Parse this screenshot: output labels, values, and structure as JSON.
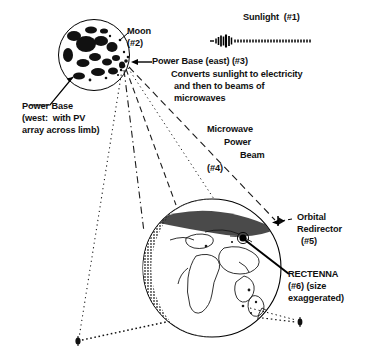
{
  "diagram": {
    "background_color": "#ffffff",
    "ink_color": "#000000"
  },
  "labels": {
    "sunlight": "Sunlight  (#1)",
    "moon_line1": "Moon",
    "moon_line2": "(#2)",
    "power_base_east_heading": "Power Base (east) (#3)",
    "power_base_east_desc_line1": "Converts sunlight to electricity",
    "power_base_east_desc_line2": "and then to beams of",
    "power_base_east_desc_line3": "microwaves",
    "power_base_west_line1": "Power Base",
    "power_base_west_line2": "(west:  with PV",
    "power_base_west_line3": "array across limb)",
    "microwave_beam_line1": "Microwave",
    "microwave_beam_line2": "Power",
    "microwave_beam_line3": "Beam",
    "microwave_beam_line4": "(#4)",
    "orbital_redirector_line1": "Orbital",
    "orbital_redirector_line2": "Redirector",
    "orbital_redirector_line3": "(#5)",
    "rectenna_line1": "RECTENNA",
    "rectenna_line2": "(#6) (size",
    "rectenna_line3": "exaggerated)"
  },
  "elements": {
    "moon": {
      "name": "Moon",
      "callout_number": "#2",
      "center_x": 94,
      "center_y": 55,
      "radius": 36,
      "lit_side": "east",
      "shaded_side": "west"
    },
    "earth": {
      "name": "Earth",
      "center_x": 212,
      "center_y": 268,
      "radius": 70,
      "terminator_side": "west"
    },
    "power_base_east": {
      "callout_number": "#3",
      "x": 126,
      "y": 62
    },
    "power_base_west": {
      "callout_number": "#2-west",
      "x": 66,
      "y": 78
    },
    "rectenna": {
      "callout_number": "#6",
      "x": 243,
      "y": 238,
      "note": "size exaggerated"
    },
    "orbital_redirector": {
      "callout_number": "#5",
      "x": 281,
      "y": 222
    },
    "satellite_bottom_left": {
      "x": 78,
      "y": 341
    },
    "satellite_bottom_right": {
      "x": 300,
      "y": 322
    }
  },
  "sunlight_wave": {
    "bar_heights": [
      3,
      5,
      8,
      11,
      9,
      12,
      7,
      10
    ],
    "dash_count": 26,
    "start_x": 212,
    "y": 41
  },
  "beams": [
    {
      "from": "power_base_east",
      "to": "satellite_bottom_left",
      "style": "dotted"
    },
    {
      "from": "power_base_east",
      "to": "earth_top",
      "style": "dash-dot"
    },
    {
      "from": "power_base_east",
      "to": "earth_upper",
      "style": "dashed"
    },
    {
      "from": "power_base_east",
      "to": "orbital_redirector",
      "style": "dashed"
    },
    {
      "from": "orbital_redirector",
      "to": "rectenna",
      "style": "dashed"
    },
    {
      "from": "satellite_bottom_left",
      "to": "earth_lower_left",
      "style": "dotted"
    },
    {
      "from": "earth_lower_right",
      "to": "satellite_bottom_right",
      "style": "dotted"
    }
  ]
}
